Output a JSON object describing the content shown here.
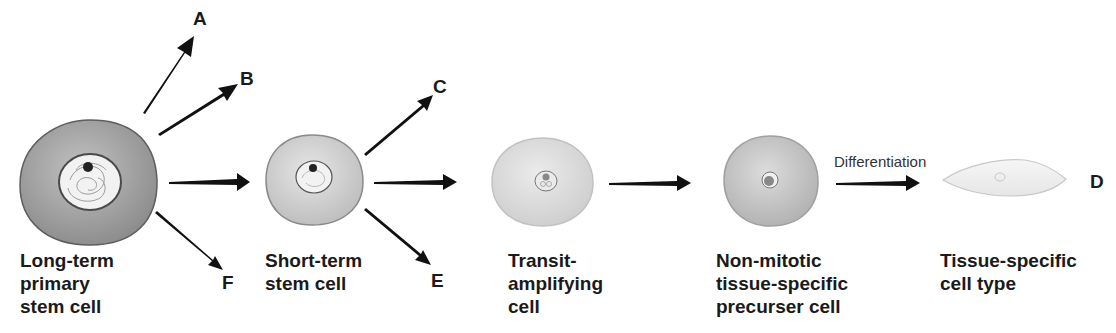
{
  "diagram": {
    "cells": [
      {
        "id": "long-term",
        "label": "Long-term\nprimary\nstem cell",
        "fill": "#9a9a9a"
      },
      {
        "id": "short-term",
        "label": "Short-term\nstem cell",
        "fill": "#c4c4c4"
      },
      {
        "id": "transit",
        "label": "Transit-\namplifying\ncell",
        "fill": "#d4d4d4"
      },
      {
        "id": "non-mitotic",
        "label": "Non-mitotic\ntissue-specific\nprecurser cell",
        "fill": "#bdbdbd"
      },
      {
        "id": "tissue-specific",
        "label": "Tissue-specific\ncell type",
        "fill": "#ececec"
      }
    ],
    "branch_letters": {
      "A": "A",
      "B": "B",
      "C": "C",
      "D": "D",
      "E": "E",
      "F": "F"
    },
    "arrow_note": "Differentiation",
    "edges": [
      {
        "from": "long-term",
        "to": "A"
      },
      {
        "from": "long-term",
        "to": "B"
      },
      {
        "from": "long-term",
        "to": "short-term"
      },
      {
        "from": "long-term",
        "to": "F"
      },
      {
        "from": "short-term",
        "to": "C"
      },
      {
        "from": "short-term",
        "to": "transit"
      },
      {
        "from": "short-term",
        "to": "E"
      },
      {
        "from": "transit",
        "to": "non-mitotic"
      },
      {
        "from": "non-mitotic",
        "to": "tissue-specific",
        "label": "Differentiation"
      },
      {
        "from": "tissue-specific",
        "to": "D"
      }
    ]
  }
}
